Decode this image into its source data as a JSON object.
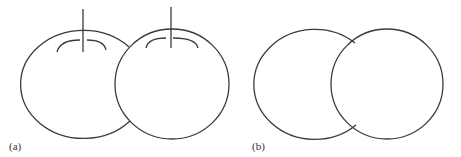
{
  "panels": [
    {
      "id": "a",
      "label": "(a)",
      "shapes": [
        {
          "name": "left-fruit",
          "cx": 83,
          "cy": 84,
          "rx": 63,
          "ry": 54,
          "stem": true
        },
        {
          "name": "right-fruit",
          "cx": 172,
          "cy": 84,
          "rx": 57,
          "ry": 55,
          "stem": true
        }
      ]
    },
    {
      "id": "b",
      "label": "(b)",
      "shapes": [
        {
          "name": "left-circle",
          "cx": 314,
          "cy": 84,
          "rx": 61,
          "ry": 55,
          "stem": false
        },
        {
          "name": "right-circle",
          "cx": 387,
          "cy": 84,
          "rx": 56,
          "ry": 55,
          "stem": false
        }
      ]
    }
  ],
  "colors": {
    "stroke": "#3a3a3a",
    "background": "#ffffff"
  }
}
